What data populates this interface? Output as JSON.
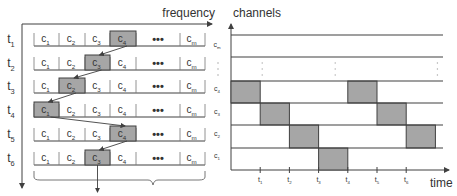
{
  "left_panel": {
    "x_axis_label": "frequency",
    "rows": [
      {
        "time": "t",
        "time_sub": "1",
        "active_index": 3,
        "active_label": "4"
      },
      {
        "time": "t",
        "time_sub": "2",
        "active_index": 2,
        "active_label": "3"
      },
      {
        "time": "t",
        "time_sub": "3",
        "active_index": 1,
        "active_label": "2"
      },
      {
        "time": "t",
        "time_sub": "4",
        "active_index": 0,
        "active_label": "1"
      },
      {
        "time": "t",
        "time_sub": "5",
        "active_index": 3,
        "active_label": "4"
      },
      {
        "time": "t",
        "time_sub": "6",
        "active_index": 2,
        "active_label": "3"
      }
    ],
    "cells": [
      {
        "base": "c",
        "sub": "1"
      },
      {
        "base": "c",
        "sub": "2"
      },
      {
        "base": "c",
        "sub": "3"
      },
      {
        "base": "c",
        "sub": "4"
      },
      {
        "base": "•••",
        "sub": ""
      },
      {
        "base": "c",
        "sub": "m"
      }
    ]
  },
  "right_panel": {
    "y_axis_label": "channels",
    "x_axis_label": "time",
    "channels": [
      {
        "base": "c",
        "sub": "m"
      },
      {
        "base": "⋮",
        "sub": ""
      },
      {
        "base": "c",
        "sub": "4"
      },
      {
        "base": "c",
        "sub": "3"
      },
      {
        "base": "c",
        "sub": "2"
      },
      {
        "base": "c",
        "sub": "1"
      }
    ],
    "time_ticks": [
      "1",
      "2",
      "3",
      "4",
      "5",
      "6"
    ],
    "hop_sequence": [
      {
        "slot": 0,
        "channel": 4
      },
      {
        "slot": 1,
        "channel": 3
      },
      {
        "slot": 2,
        "channel": 2
      },
      {
        "slot": 3,
        "channel": 1
      },
      {
        "slot": 4,
        "channel": 4
      },
      {
        "slot": 5,
        "channel": 3
      },
      {
        "slot": 6,
        "channel": 2
      }
    ]
  },
  "colors": {
    "active_fill": "#a6a6a6",
    "active_border": "#404040",
    "line": "#404040",
    "text": "#333333"
  }
}
